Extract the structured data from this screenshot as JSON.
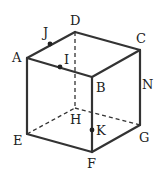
{
  "diagram": {
    "type": "cube",
    "vertices": [
      {
        "name": "A",
        "label": "A",
        "x": 27,
        "y": 58,
        "lx": 12,
        "ly": 62
      },
      {
        "name": "B",
        "label": "B",
        "x": 92,
        "y": 77,
        "lx": 96,
        "ly": 92
      },
      {
        "name": "C",
        "label": "C",
        "x": 140,
        "y": 50,
        "lx": 136,
        "ly": 43
      },
      {
        "name": "D",
        "label": "D",
        "x": 75,
        "y": 32,
        "lx": 70,
        "ly": 25
      },
      {
        "name": "E",
        "label": "E",
        "x": 27,
        "y": 134,
        "lx": 13,
        "ly": 145
      },
      {
        "name": "F",
        "label": "F",
        "x": 92,
        "y": 152,
        "lx": 87,
        "ly": 168
      },
      {
        "name": "G",
        "label": "G",
        "x": 140,
        "y": 125,
        "lx": 139,
        "ly": 142
      },
      {
        "name": "H",
        "label": "H",
        "x": 75,
        "y": 108,
        "lx": 70,
        "ly": 124
      }
    ],
    "points": [
      {
        "name": "J",
        "label": "J",
        "x": 50,
        "y": 44,
        "lx": 43,
        "ly": 37
      },
      {
        "name": "I",
        "label": "I",
        "x": 60,
        "y": 67,
        "lx": 64,
        "ly": 64
      },
      {
        "name": "K",
        "label": "K",
        "x": 92,
        "y": 130,
        "lx": 96,
        "ly": 135
      }
    ],
    "extra_labels": [
      {
        "name": "N",
        "label": "N",
        "lx": 142,
        "ly": 89
      }
    ]
  }
}
